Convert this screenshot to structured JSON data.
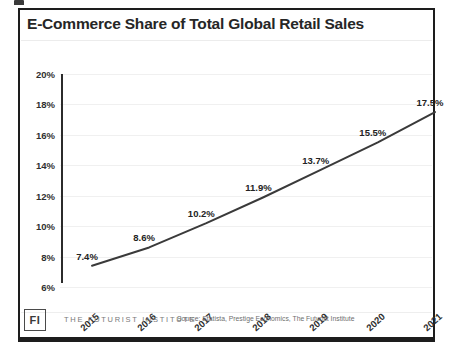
{
  "card": {
    "title": "E-Commerce Share of Total Global Retail Sales",
    "border_color": "#1d1d1d",
    "background": "#ffffff"
  },
  "footer": {
    "logo_text": "FI",
    "brand": "THE FUTURIST INSTITUTE",
    "source": "Source: Statista, Prestige Economics, The Futurist Institute"
  },
  "chart_data": {
    "type": "line",
    "title": "E-Commerce Share of Total Global Retail Sales",
    "xlabel": "",
    "ylabel": "",
    "categories": [
      "2015",
      "2016",
      "2017",
      "2018",
      "2019",
      "2020",
      "2021"
    ],
    "values": [
      7.4,
      8.6,
      10.2,
      11.9,
      13.7,
      15.5,
      17.5
    ],
    "point_labels": [
      "7.4%",
      "8.6%",
      "10.2%",
      "11.9%",
      "13.7%",
      "15.5%",
      "17.5%"
    ],
    "ylim": [
      6,
      20
    ],
    "yticks": [
      20,
      18,
      16,
      14,
      12,
      10,
      8,
      6
    ],
    "ytick_labels": [
      "20%",
      "18%",
      "16%",
      "14%",
      "12%",
      "10%",
      "8%",
      "6%"
    ],
    "grid": true,
    "grid_color": "#f0f0f0",
    "legend": "none",
    "line_color": "#3a3a3a",
    "line_width": 2,
    "markers": false
  }
}
